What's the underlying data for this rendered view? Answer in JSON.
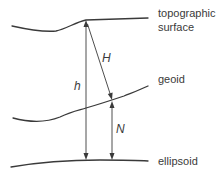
{
  "diagram": {
    "surfaces": [
      {
        "id": "topographic",
        "label_line1": "topographic",
        "label_line2": "surface"
      },
      {
        "id": "geoid",
        "label_line1": "geoid"
      },
      {
        "id": "ellipsoid",
        "label_line1": "ellipsoid"
      }
    ],
    "quantities": {
      "ellipsoidal_height": "h",
      "orthometric_height": "H",
      "geoid_undulation": "N"
    },
    "colors": {
      "line": "#3a3a3a",
      "background": "#ffffff"
    }
  }
}
